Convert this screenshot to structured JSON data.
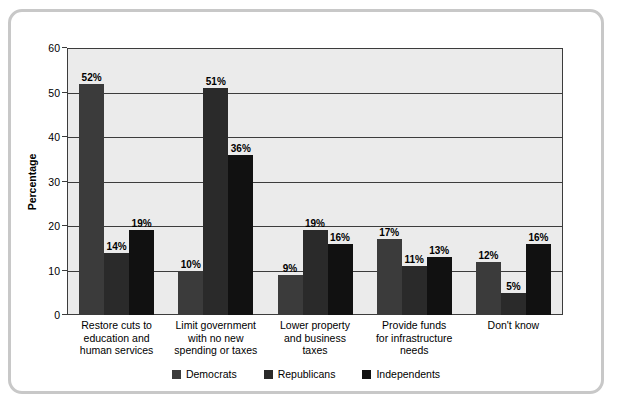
{
  "chart_data": {
    "type": "bar",
    "title": "",
    "subtitle": "",
    "xlabel": "",
    "ylabel": "Percentage",
    "ylim": [
      0,
      60
    ],
    "ytick_step": 10,
    "yticks": [
      "0",
      "10",
      "20",
      "30",
      "40",
      "50",
      "60"
    ],
    "grid": true,
    "grid_axis": "y",
    "legend_position": "bottom-center",
    "value_label_suffix": "%",
    "categories": [
      "Restore cuts to education and human services",
      "Limit government with no new spending or taxes",
      "Lower property and business taxes",
      "Provide funds for infrastructure needs",
      "Don't know"
    ],
    "category_label_lines": [
      [
        "Restore cuts to",
        "education and",
        "human services"
      ],
      [
        "Limit government",
        "with no new",
        "spending or taxes"
      ],
      [
        "Lower property",
        "and business",
        "taxes"
      ],
      [
        "Provide funds",
        "for infrastructure",
        "needs"
      ],
      [
        "Don't know"
      ]
    ],
    "series": [
      {
        "name": "Democrats",
        "color": "#3b3b3b",
        "values": [
          52,
          10,
          9,
          17,
          12
        ],
        "labels": [
          "52%",
          "10%",
          "9%",
          "17%",
          "12%"
        ]
      },
      {
        "name": "Republicans",
        "color": "#2a2a2a",
        "values": [
          14,
          51,
          19,
          11,
          5
        ],
        "labels": [
          "14%",
          "51%",
          "19%",
          "11%",
          "5%"
        ]
      },
      {
        "name": "Independents",
        "color": "#111111",
        "values": [
          19,
          36,
          16,
          13,
          16
        ],
        "labels": [
          "19%",
          "36%",
          "16%",
          "13%",
          "16%"
        ]
      }
    ]
  },
  "style": {
    "frame_border_color": "#c8c8c8",
    "plot_background": "#ebebeb",
    "axis_color": "#3c3c3c",
    "page_background": "#ffffff"
  }
}
